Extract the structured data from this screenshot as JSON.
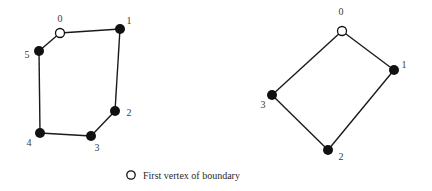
{
  "diagrams": [
    {
      "name": "hexagon-polygon",
      "vertices": [
        {
          "label": "0",
          "x": 60,
          "y": 33,
          "first": true,
          "lx": 60,
          "ly": 22
        },
        {
          "label": "1",
          "x": 120,
          "y": 29,
          "first": false,
          "lx": 129,
          "ly": 24
        },
        {
          "label": "2",
          "x": 115,
          "y": 111,
          "first": false,
          "lx": 129,
          "ly": 116
        },
        {
          "label": "3",
          "x": 91,
          "y": 136,
          "first": false,
          "lx": 97,
          "ly": 151
        },
        {
          "label": "4",
          "x": 40,
          "y": 133,
          "first": false,
          "lx": 29,
          "ly": 146
        },
        {
          "label": "5",
          "x": 39,
          "y": 51,
          "first": false,
          "lx": 27,
          "ly": 58
        }
      ]
    },
    {
      "name": "quadrilateral-polygon",
      "vertices": [
        {
          "label": "0",
          "x": 342,
          "y": 31,
          "first": true,
          "lx": 341,
          "ly": 15
        },
        {
          "label": "1",
          "x": 394,
          "y": 70,
          "first": false,
          "lx": 404,
          "ly": 68
        },
        {
          "label": "2",
          "x": 328,
          "y": 150,
          "first": false,
          "lx": 341,
          "ly": 160
        },
        {
          "label": "3",
          "x": 272,
          "y": 95,
          "first": false,
          "lx": 263,
          "ly": 108
        }
      ]
    }
  ],
  "legend": {
    "symbol": "hollow-circle",
    "text": "First vertex of boundary"
  },
  "colors": {
    "vertex_fill": "#111111",
    "edge": "#1a1a1a",
    "label": "#3a3a3a"
  }
}
